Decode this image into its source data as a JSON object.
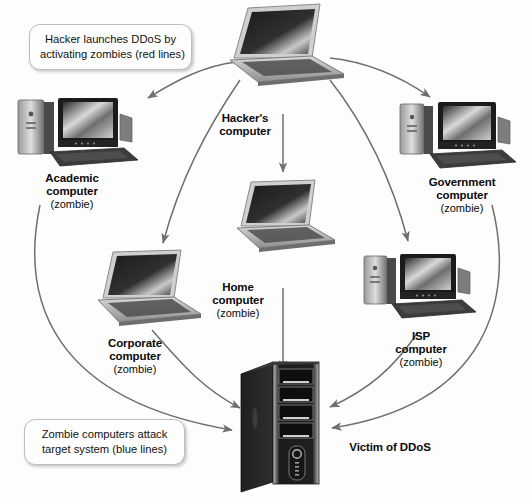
{
  "diagram": {
    "background_color": "#fdfdfd",
    "arrow_color": "#6b6b6b",
    "text_color": "#0a0a0a"
  },
  "callouts": [
    {
      "name": "hacker-callout",
      "line1": "Hacker launches DDoS by",
      "line2": "activating zombies (red lines)"
    },
    {
      "name": "zombie-callout",
      "line1": "Zombie computers attack",
      "line2": "target system (blue lines)"
    }
  ],
  "nodes": [
    {
      "id": "hacker",
      "name": "hackers-computer",
      "label": "Hacker's",
      "label2": "computer",
      "sub": "",
      "device": "laptop"
    },
    {
      "id": "academic",
      "name": "academic-computer",
      "label": "Academic",
      "label2": "computer",
      "sub": "(zombie)",
      "device": "desktop"
    },
    {
      "id": "government",
      "name": "government-computer",
      "label": "Government",
      "label2": "computer",
      "sub": "(zombie)",
      "device": "desktop"
    },
    {
      "id": "corporate",
      "name": "corporate-computer",
      "label": "Corporate",
      "label2": "computer",
      "sub": "(zombie)",
      "device": "laptop"
    },
    {
      "id": "home",
      "name": "home-computer",
      "label": "Home",
      "label2": "computer",
      "sub": "(zombie)",
      "device": "laptop"
    },
    {
      "id": "isp",
      "name": "isp-computer",
      "label": "ISP",
      "label2": "computer",
      "sub": "(zombie)",
      "device": "desktop"
    },
    {
      "id": "victim",
      "name": "victim-server",
      "label": "Victim of DDoS",
      "label2": "",
      "sub": "",
      "device": "server"
    }
  ]
}
